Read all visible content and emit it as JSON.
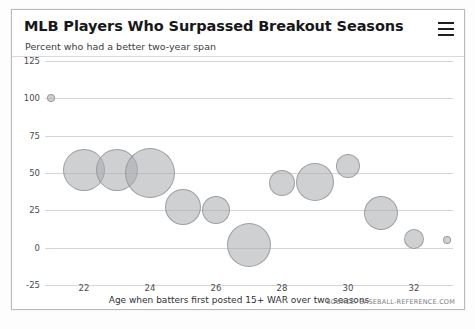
{
  "card": {
    "title": "MLB Players Who Surpassed Breakout Seasons",
    "subtitle": "Percent who had a better two-year span",
    "menu_label": "menu",
    "source": "SOURCE: BASEBALL-REFERENCE.COM"
  },
  "colors": {
    "bubble_fill": "#a8aaad",
    "bubble_stroke": "#8c8e92",
    "grid": "#d5d5d5",
    "border": "#b9b9b9",
    "text": "#17181a"
  },
  "chart_data": {
    "type": "scatter",
    "title": "MLB Players Who Surpassed Breakout Seasons",
    "subtitle": "Percent who had a better two-year span",
    "xlabel": "Age when batters first posted 15+ WAR over two seasons",
    "ylabel": "Percent who had a better two-year span",
    "xlim": [
      20.7,
      33.6
    ],
    "ylim": [
      -25,
      125
    ],
    "xticks": [
      22,
      24,
      26,
      28,
      30,
      32
    ],
    "yticks": [
      -25,
      0,
      25,
      50,
      75,
      100,
      125
    ],
    "grid": true,
    "legend": null,
    "source": "SOURCE: BASEBALL-REFERENCE.COM",
    "points": [
      {
        "age": 21,
        "percent": 100,
        "size": 4
      },
      {
        "age": 22,
        "percent": 52,
        "size": 21
      },
      {
        "age": 23,
        "percent": 52,
        "size": 21
      },
      {
        "age": 24,
        "percent": 50,
        "size": 25
      },
      {
        "age": 25,
        "percent": 27,
        "size": 18
      },
      {
        "age": 26,
        "percent": 25,
        "size": 14
      },
      {
        "age": 27,
        "percent": 2,
        "size": 22
      },
      {
        "age": 28,
        "percent": 43,
        "size": 13
      },
      {
        "age": 29,
        "percent": 44,
        "size": 19
      },
      {
        "age": 30,
        "percent": 55,
        "size": 12
      },
      {
        "age": 31,
        "percent": 23,
        "size": 17
      },
      {
        "age": 32,
        "percent": 6,
        "size": 10
      },
      {
        "age": 33,
        "percent": 5,
        "size": 4
      }
    ]
  }
}
